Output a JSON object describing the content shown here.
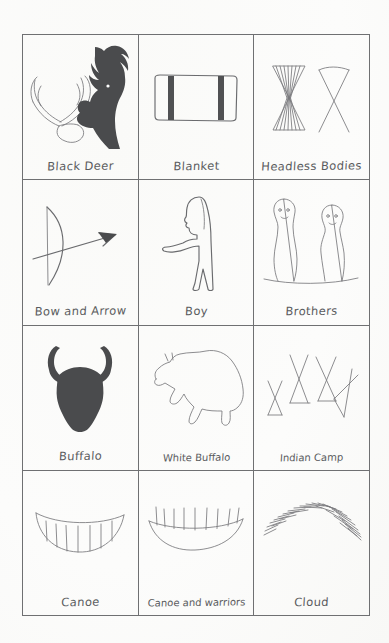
{
  "document": {
    "title": "Native American Pictograph Symbol Chart",
    "medium": "hand-drawn pencil on white paper",
    "grid_rows": 4,
    "grid_columns": 3
  },
  "palette": {
    "paper": "#fefefe",
    "grid_line": "#6f7072",
    "ink": "#6a6b6e",
    "fill_dark": "#4a4b4d",
    "label_text": "#5a5b5e"
  },
  "cells": [
    {
      "id": "black-deer",
      "label": "Black Deer",
      "icon": "deer-head-icon"
    },
    {
      "id": "blanket",
      "label": "Blanket",
      "icon": "blanket-icon"
    },
    {
      "id": "headless-bodies",
      "label": "Headless Bodies",
      "icon": "hourglass-bodies-icon"
    },
    {
      "id": "bow-and-arrow",
      "label": "Bow and Arrow",
      "icon": "bow-arrow-icon"
    },
    {
      "id": "boy",
      "label": "Boy",
      "icon": "standing-boy-icon"
    },
    {
      "id": "brothers",
      "label": "Brothers",
      "icon": "two-figures-icon"
    },
    {
      "id": "buffalo",
      "label": "Buffalo",
      "icon": "buffalo-head-icon"
    },
    {
      "id": "white-buffalo",
      "label": "White Buffalo",
      "icon": "buffalo-outline-icon"
    },
    {
      "id": "indian-camp",
      "label": "Indian Camp",
      "icon": "tepees-icon"
    },
    {
      "id": "canoe",
      "label": "Canoe",
      "icon": "canoe-icon"
    },
    {
      "id": "canoe-and-warriors",
      "label": "Canoe and warriors",
      "icon": "canoe-warriors-icon"
    },
    {
      "id": "cloud",
      "label": "Cloud",
      "icon": "cloud-hatch-icon"
    }
  ]
}
